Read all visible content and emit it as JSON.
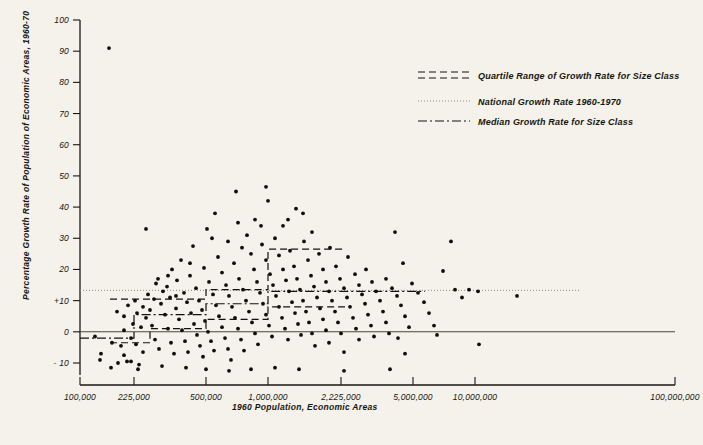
{
  "chart_data": {
    "type": "scatter",
    "title": "",
    "xlabel": "1960 Population, Economic Areas",
    "ylabel": "Percentage Growth Rate of Population of Economic Areas, 1960-70",
    "x_scale": "log",
    "xlim": [
      100000,
      100000000
    ],
    "ylim": [
      -15,
      100
    ],
    "grid": false,
    "xticks": [
      {
        "value": 100000,
        "label": "100,000",
        "px": 80
      },
      {
        "value": 225000,
        "label": "225,000",
        "px": 134
      },
      {
        "value": 500000,
        "label": "500,000",
        "px": 206
      },
      {
        "value": 1000000,
        "label": "1,000,000",
        "px": 268
      },
      {
        "value": 2225000,
        "label": "2,225,000",
        "px": 341
      },
      {
        "value": 5000000,
        "label": "5,000,000",
        "px": 413
      },
      {
        "value": 10000000,
        "label": "10,000,000",
        "px": 475
      },
      {
        "value": 100000000,
        "label": "100,000,000",
        "px": 675
      }
    ],
    "yticks": [
      {
        "value": 100,
        "label": "100"
      },
      {
        "value": 90,
        "label": "90"
      },
      {
        "value": 80,
        "label": "80"
      },
      {
        "value": 70,
        "label": "70"
      },
      {
        "value": 60,
        "label": "60"
      },
      {
        "value": 50,
        "label": "50"
      },
      {
        "value": 40,
        "label": "40"
      },
      {
        "value": 30,
        "label": "30"
      },
      {
        "value": 20,
        "label": "20"
      },
      {
        "value": 10,
        "label": "+10"
      },
      {
        "value": 0,
        "label": "0"
      },
      {
        "value": -10,
        "label": "- 10"
      }
    ],
    "legend": {
      "position": "upper-right",
      "entries": [
        {
          "key": "quartile",
          "label": "Quartile Range of Growth Rate for Size Class",
          "style": "dashed-pair"
        },
        {
          "key": "national",
          "label": "National Growth Rate 1960-1970",
          "style": "dotted"
        },
        {
          "key": "median",
          "label": "Median Growth Rate for Size Class",
          "style": "dash-dot"
        }
      ]
    },
    "reference_lines": {
      "national_growth_rate": {
        "value": 13.3,
        "style": "dotted",
        "x_from": 80,
        "x_to": 580
      },
      "zero_line": {
        "value": 0,
        "style": "solid",
        "x_from": 80,
        "x_to": 675
      },
      "median_steps": [
        {
          "x_from": 80,
          "x_to": 134,
          "value": -2.0
        },
        {
          "x_from": 134,
          "x_to": 206,
          "value": 5.5
        },
        {
          "x_from": 206,
          "x_to": 268,
          "value": 9.0
        },
        {
          "x_from": 268,
          "x_to": 425,
          "value": 13.0
        }
      ],
      "upper_quartile_steps": [
        {
          "x_from": 110,
          "x_to": 206,
          "value": 10.5
        },
        {
          "x_from": 206,
          "x_to": 268,
          "value": 13.5
        },
        {
          "x_from": 268,
          "x_to": 345,
          "value": 26.5
        }
      ],
      "lower_quartile_steps": [
        {
          "x_from": 110,
          "x_to": 150,
          "value": -3.5
        },
        {
          "x_from": 150,
          "x_to": 206,
          "value": 1.0
        },
        {
          "x_from": 206,
          "x_to": 268,
          "value": 4.0
        },
        {
          "x_from": 268,
          "x_to": 345,
          "value": 8.0
        }
      ]
    },
    "points": [
      [
        109,
        91
      ],
      [
        146,
        33
      ],
      [
        156,
        15.5
      ],
      [
        100,
        -9
      ],
      [
        118,
        -10
      ],
      [
        127,
        -9.5
      ],
      [
        131,
        -9.5
      ],
      [
        139,
        -10.5
      ],
      [
        95,
        -1.5
      ],
      [
        112,
        -3.5
      ],
      [
        121,
        -4.5
      ],
      [
        124,
        0.5
      ],
      [
        131,
        -2.0
      ],
      [
        136,
        -4.0
      ],
      [
        143,
        -6.5
      ],
      [
        117,
        6.5
      ],
      [
        124,
        5.0
      ],
      [
        133,
        2.5
      ],
      [
        137,
        6.0
      ],
      [
        141,
        1.5
      ],
      [
        146,
        4.5
      ],
      [
        150,
        7.0
      ],
      [
        152,
        2.0
      ],
      [
        155,
        -2.5
      ],
      [
        159,
        -5.5
      ],
      [
        148,
        12.0
      ],
      [
        154,
        10.5
      ],
      [
        161,
        9.0
      ],
      [
        165,
        5.5
      ],
      [
        168,
        1.0
      ],
      [
        171,
        -3.5
      ],
      [
        174,
        -7.0
      ],
      [
        163,
        13.0
      ],
      [
        167,
        14.5
      ],
      [
        170,
        11.0
      ],
      [
        176,
        7.5
      ],
      [
        179,
        4.0
      ],
      [
        182,
        0.5
      ],
      [
        185,
        -3.0
      ],
      [
        188,
        -6.5
      ],
      [
        172,
        20.0
      ],
      [
        177,
        16.5
      ],
      [
        184,
        12.5
      ],
      [
        187,
        9.5
      ],
      [
        191,
        6.0
      ],
      [
        194,
        2.5
      ],
      [
        197,
        -1.0
      ],
      [
        200,
        -4.5
      ],
      [
        203,
        -8.0
      ],
      [
        181,
        23.0
      ],
      [
        190,
        18.0
      ],
      [
        196,
        14.0
      ],
      [
        199,
        10.0
      ],
      [
        202,
        7.0
      ],
      [
        205,
        3.5
      ],
      [
        208,
        0.0
      ],
      [
        211,
        -3.0
      ],
      [
        214,
        -6.0
      ],
      [
        193,
        27.5
      ],
      [
        204,
        20.5
      ],
      [
        209,
        16.0
      ],
      [
        213,
        12.0
      ],
      [
        216,
        8.5
      ],
      [
        219,
        5.0
      ],
      [
        222,
        1.5
      ],
      [
        225,
        -2.0
      ],
      [
        228,
        -5.5
      ],
      [
        231,
        -9.0
      ],
      [
        207,
        33.0
      ],
      [
        218,
        24.0
      ],
      [
        222,
        19.0
      ],
      [
        226,
        15.0
      ],
      [
        229,
        11.5
      ],
      [
        232,
        8.0
      ],
      [
        235,
        4.5
      ],
      [
        238,
        1.0
      ],
      [
        241,
        -2.5
      ],
      [
        244,
        -6.0
      ],
      [
        215,
        38.0
      ],
      [
        228,
        29.0
      ],
      [
        234,
        22.0
      ],
      [
        239,
        17.0
      ],
      [
        243,
        13.5
      ],
      [
        246,
        10.0
      ],
      [
        249,
        6.5
      ],
      [
        252,
        3.0
      ],
      [
        255,
        -0.5
      ],
      [
        258,
        -4.0
      ],
      [
        236,
        45.0
      ],
      [
        247,
        31.0
      ],
      [
        251,
        25.0
      ],
      [
        254,
        20.0
      ],
      [
        257,
        16.0
      ],
      [
        260,
        12.5
      ],
      [
        263,
        9.0
      ],
      [
        266,
        5.5
      ],
      [
        269,
        2.0
      ],
      [
        272,
        -1.5
      ],
      [
        255,
        36.0
      ],
      [
        262,
        28.0
      ],
      [
        266,
        23.0
      ],
      [
        270,
        18.5
      ],
      [
        273,
        15.0
      ],
      [
        276,
        11.5
      ],
      [
        279,
        8.0
      ],
      [
        282,
        4.5
      ],
      [
        285,
        1.0
      ],
      [
        288,
        -2.5
      ],
      [
        268,
        42.0
      ],
      [
        275,
        30.0
      ],
      [
        279,
        24.5
      ],
      [
        283,
        20.0
      ],
      [
        286,
        16.5
      ],
      [
        289,
        13.0
      ],
      [
        292,
        9.5
      ],
      [
        295,
        6.0
      ],
      [
        298,
        2.5
      ],
      [
        301,
        -1.0
      ],
      [
        283,
        34.0
      ],
      [
        290,
        26.0
      ],
      [
        294,
        21.0
      ],
      [
        297,
        17.0
      ],
      [
        300,
        13.5
      ],
      [
        303,
        10.0
      ],
      [
        306,
        6.5
      ],
      [
        309,
        3.0
      ],
      [
        312,
        -0.5
      ],
      [
        315,
        -4.5
      ],
      [
        296,
        39.5
      ],
      [
        304,
        29.0
      ],
      [
        308,
        23.0
      ],
      [
        311,
        18.0
      ],
      [
        314,
        14.5
      ],
      [
        317,
        11.0
      ],
      [
        320,
        7.5
      ],
      [
        323,
        4.0
      ],
      [
        326,
        0.5
      ],
      [
        329,
        -3.5
      ],
      [
        312,
        32.0
      ],
      [
        319,
        25.0
      ],
      [
        323,
        20.0
      ],
      [
        326,
        16.0
      ],
      [
        329,
        13.0
      ],
      [
        332,
        10.0
      ],
      [
        335,
        6.5
      ],
      [
        338,
        3.0
      ],
      [
        341,
        -0.5
      ],
      [
        344,
        -6.5
      ],
      [
        330,
        27.0
      ],
      [
        336,
        21.0
      ],
      [
        340,
        17.0
      ],
      [
        344,
        14.0
      ],
      [
        347,
        11.0
      ],
      [
        350,
        8.0
      ],
      [
        353,
        4.5
      ],
      [
        356,
        1.0
      ],
      [
        359,
        -2.5
      ],
      [
        348,
        24.0
      ],
      [
        355,
        18.5
      ],
      [
        359,
        15.0
      ],
      [
        362,
        12.0
      ],
      [
        365,
        9.0
      ],
      [
        368,
        5.5
      ],
      [
        371,
        2.0
      ],
      [
        374,
        -1.5
      ],
      [
        366,
        20.0
      ],
      [
        372,
        16.0
      ],
      [
        376,
        13.0
      ],
      [
        380,
        10.0
      ],
      [
        383,
        6.5
      ],
      [
        386,
        3.0
      ],
      [
        389,
        -0.5
      ],
      [
        386,
        17.0
      ],
      [
        392,
        14.0
      ],
      [
        397,
        11.5
      ],
      [
        401,
        8.5
      ],
      [
        405,
        5.0
      ],
      [
        409,
        1.5
      ],
      [
        395,
        32.0
      ],
      [
        403,
        22.0
      ],
      [
        412,
        15.5
      ],
      [
        418,
        12.5
      ],
      [
        424,
        9.5
      ],
      [
        429,
        6.0
      ],
      [
        434,
        2.0
      ],
      [
        451,
        29.0
      ],
      [
        443,
        19.5
      ],
      [
        455,
        13.5
      ],
      [
        462,
        11.0
      ],
      [
        469,
        13.5
      ],
      [
        478,
        13.0
      ],
      [
        517,
        11.5
      ],
      [
        437,
        -1.0
      ],
      [
        398,
        -2.0
      ],
      [
        405,
        -7.0
      ],
      [
        479,
        -4.0
      ],
      [
        186,
        -11.5
      ],
      [
        206,
        -12.0
      ],
      [
        229,
        -12.5
      ],
      [
        251,
        -12.0
      ],
      [
        275,
        -11.5
      ],
      [
        299,
        -12.0
      ],
      [
        344,
        -12.5
      ],
      [
        390,
        -12.0
      ],
      [
        162,
        -11.0
      ],
      [
        138,
        -12.0
      ],
      [
        111,
        -11.5
      ],
      [
        124,
        -7.5
      ],
      [
        101,
        -7.0
      ],
      [
        128,
        8.5
      ],
      [
        135,
        10.0
      ],
      [
        143,
        8.0
      ],
      [
        158,
        17.0
      ],
      [
        168,
        18.0
      ],
      [
        176,
        11.5
      ],
      [
        190,
        22.0
      ],
      [
        212,
        30.0
      ],
      [
        242,
        27.0
      ],
      [
        261,
        34.0
      ],
      [
        288,
        36.0
      ],
      [
        303,
        38.0
      ],
      [
        266,
        46.5
      ],
      [
        238,
        35.0
      ]
    ]
  }
}
